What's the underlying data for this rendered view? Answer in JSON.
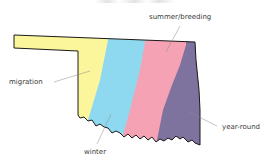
{
  "map": {
    "region": "Oklahoma",
    "colors": {
      "migration": "#fbf59c",
      "winter": "#8fd9f0",
      "summer_breeding": "#f5a2b5",
      "year_round": "#7d739e",
      "outline": "#1a1a1a",
      "leader_line": "#8a8a8a"
    },
    "legend_labels": {
      "summer_breeding": "summer/breeding",
      "migration": "migration",
      "winter": "winter",
      "year_round": "year-round"
    }
  }
}
